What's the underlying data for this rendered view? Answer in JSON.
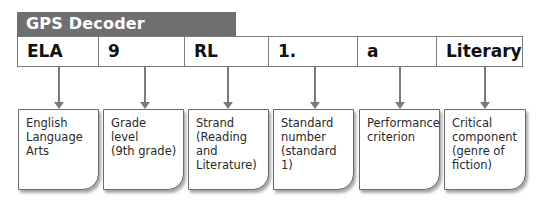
{
  "header": {
    "title": "GPS Decoder"
  },
  "colors": {
    "header_bg": "#6f6f6f",
    "border": "#7a7a7a"
  },
  "codes": [
    {
      "label": "ELA"
    },
    {
      "label": "9"
    },
    {
      "label": "RL"
    },
    {
      "label": "1."
    },
    {
      "label": "a"
    },
    {
      "label": "Literary"
    }
  ],
  "descriptions": [
    {
      "text": "English\nLanguage\nArts"
    },
    {
      "text": "Grade level\n(9th grade)"
    },
    {
      "text": "Strand\n(Reading\nand\nLiterature)"
    },
    {
      "text": "Standard\nnumber\n(standard 1)"
    },
    {
      "text": "Performance\ncriterion"
    },
    {
      "text": "Critical\ncomponent\n(genre of\nfiction)"
    }
  ]
}
